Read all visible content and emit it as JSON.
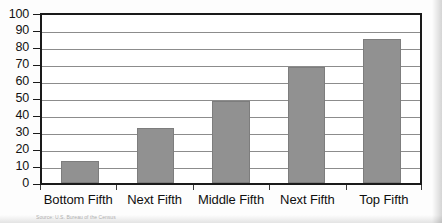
{
  "chart_data": {
    "type": "bar",
    "title": "",
    "subtitle": "",
    "xlabel": "",
    "ylabel": "",
    "categories": [
      "Bottom Fifth",
      "Next Fifth",
      "Middle Fifth",
      "Next Fifth",
      "Top Fifth"
    ],
    "values": [
      13,
      33,
      49,
      69,
      86
    ],
    "ylim": [
      0,
      100
    ],
    "ytick_step": 10,
    "yticks": [
      "100",
      "90",
      "80",
      "70",
      "60",
      "50",
      "40",
      "30",
      "20",
      "10",
      "0"
    ],
    "grid": true,
    "grid_axis": "y",
    "legend": false,
    "legend_position": "none",
    "series": [
      {
        "name": "",
        "values": [
          13,
          33,
          49,
          69,
          86
        ]
      }
    ]
  },
  "colors": {
    "bar_fill": "#919191",
    "bar_border": "#7d7d7d",
    "axis": "#1a1a1a",
    "gridline": "#8c8c8c",
    "text": "#0f0f0f",
    "plot_background": "#ffffff",
    "page_background": "#fdfdfd"
  },
  "caption": {
    "source": "Source: U.S. Bureau of the Census"
  }
}
